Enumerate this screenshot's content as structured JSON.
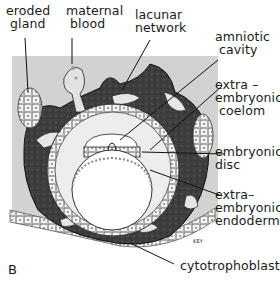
{
  "figure": {
    "panel_letter": "B",
    "labels": {
      "eroded_gland": "eroded\n gland",
      "maternal_blood": "maternal\n blood",
      "lacunar_network": "lacunar\nnetwork",
      "amniotic_cavity": "amniotic\n cavity",
      "extraembryonic_coelom": "extra –\nembryonic\n coelom",
      "embryonic_disc": "embryonic\ndisc",
      "extraembryonic_endoderm": "extra–\nembryonic\nendoderm",
      "cytotrophoblast": "cytotrophoblast"
    },
    "key_tag": "KEY",
    "colors": {
      "background_tissue": "#d0d0d0",
      "syncytiotrophoblast": "#3a3a3a",
      "lacunae": "#e8e8e8",
      "cells": "#f4f4f4",
      "cavity": "#ffffff",
      "ink": "#1a1a1a"
    }
  }
}
